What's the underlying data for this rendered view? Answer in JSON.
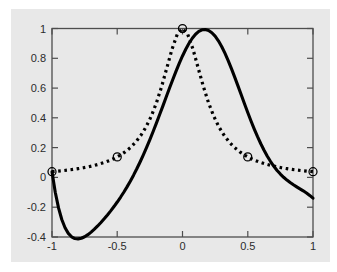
{
  "figure": {
    "background_color": "#e8e8e8",
    "page_background_color": "#ffffff",
    "axis_color": "#4d4d4d",
    "curve_color": "#000000"
  },
  "chart_data": {
    "type": "line",
    "title": "",
    "subtitle": "",
    "xlabel": "",
    "ylabel": "",
    "xlim": [
      -1,
      1
    ],
    "ylim": [
      -0.4,
      1
    ],
    "grid": false,
    "legend": null,
    "legend_position": "none",
    "xticks": [
      -1,
      -0.5,
      0,
      0.5,
      1
    ],
    "xticklabels": [
      "-1",
      "-0.5",
      "0",
      "0.5",
      "1"
    ],
    "yticks": [
      -0.4,
      -0.2,
      0,
      0.2,
      0.4,
      0.6,
      0.8,
      1
    ],
    "yticklabels": [
      "-0.4",
      "-0.2",
      "0",
      "0.2",
      "0.4",
      "0.6",
      "0.8",
      "1"
    ],
    "series": [
      {
        "name": "interpolant",
        "style": "solid",
        "linewidth": 3.1,
        "color": "#000000",
        "x": [
          -1.0,
          -0.975,
          -0.95,
          -0.925,
          -0.9,
          -0.875,
          -0.85,
          -0.825,
          -0.8,
          -0.775,
          -0.75,
          -0.725,
          -0.7,
          -0.675,
          -0.65,
          -0.625,
          -0.6,
          -0.575,
          -0.55,
          -0.525,
          -0.5,
          -0.475,
          -0.45,
          -0.425,
          -0.4,
          -0.375,
          -0.35,
          -0.325,
          -0.3,
          -0.275,
          -0.25,
          -0.225,
          -0.2,
          -0.175,
          -0.15,
          -0.125,
          -0.1,
          -0.075,
          -0.05,
          -0.025,
          0.0,
          0.025,
          0.05,
          0.075,
          0.1,
          0.125,
          0.15,
          0.175,
          0.2,
          0.225,
          0.25,
          0.275,
          0.3,
          0.325,
          0.35,
          0.375,
          0.4,
          0.425,
          0.45,
          0.475,
          0.5,
          0.525,
          0.55,
          0.575,
          0.6,
          0.625,
          0.65,
          0.675,
          0.7,
          0.725,
          0.75,
          0.775,
          0.8,
          0.825,
          0.85,
          0.875,
          0.9,
          0.925,
          0.95,
          0.975,
          1.0
        ],
        "y": [
          0.0385,
          -0.0996,
          -0.2046,
          -0.2824,
          -0.3379,
          -0.3755,
          -0.3986,
          -0.4102,
          -0.4127,
          -0.4083,
          -0.3984,
          -0.3844,
          -0.3672,
          -0.3475,
          -0.3259,
          -0.3026,
          -0.2779,
          -0.2518,
          -0.2244,
          -0.1955,
          -0.1652,
          -0.1332,
          -0.0993,
          -0.0634,
          -0.0253,
          0.0152,
          0.0581,
          0.1035,
          0.1513,
          0.2015,
          0.2539,
          0.3083,
          0.3645,
          0.4221,
          0.4806,
          0.5396,
          0.5983,
          0.6561,
          0.7122,
          0.7656,
          0.8155,
          0.8609,
          0.9009,
          0.9347,
          0.9614,
          0.9803,
          0.9911,
          0.9933,
          0.9868,
          0.9717,
          0.9484,
          0.9172,
          0.879,
          0.8345,
          0.7848,
          0.7308,
          0.6737,
          0.6146,
          0.5546,
          0.4948,
          0.436,
          0.3791,
          0.3248,
          0.2737,
          0.226,
          0.1823,
          0.1425,
          0.1068,
          0.075,
          0.047,
          0.0224,
          0.0009,
          -0.0179,
          -0.0345,
          -0.0494,
          -0.0631,
          -0.0764,
          -0.0899,
          -0.1044,
          -0.1206,
          -0.1395
        ]
      },
      {
        "name": "runge-function",
        "style": "dotted",
        "linewidth": 3.2,
        "color": "#000000",
        "x": [
          -1.0,
          -0.96,
          -0.92,
          -0.88,
          -0.84,
          -0.8,
          -0.76,
          -0.72,
          -0.68,
          -0.64,
          -0.6,
          -0.56,
          -0.52,
          -0.48,
          -0.44,
          -0.4,
          -0.36,
          -0.32,
          -0.28,
          -0.24,
          -0.2,
          -0.16,
          -0.12,
          -0.08,
          -0.04,
          0.0,
          0.04,
          0.08,
          0.12,
          0.16,
          0.2,
          0.24,
          0.28,
          0.32,
          0.36,
          0.4,
          0.44,
          0.48,
          0.52,
          0.56,
          0.6,
          0.64,
          0.68,
          0.72,
          0.76,
          0.8,
          0.84,
          0.88,
          0.92,
          0.96,
          1.0
        ],
        "y": [
          0.0385,
          0.0416,
          0.0451,
          0.0491,
          0.0536,
          0.0588,
          0.0647,
          0.0716,
          0.0796,
          0.089,
          0.1,
          0.1131,
          0.1289,
          0.1479,
          0.1713,
          0.2,
          0.2358,
          0.2809,
          0.3378,
          0.4098,
          0.5,
          0.6098,
          0.7353,
          0.8621,
          0.9615,
          1.0,
          0.9615,
          0.8621,
          0.7353,
          0.6098,
          0.5,
          0.4098,
          0.3378,
          0.2809,
          0.2358,
          0.2,
          0.1713,
          0.1479,
          0.1289,
          0.1131,
          0.1,
          0.089,
          0.0796,
          0.0716,
          0.0647,
          0.0588,
          0.0536,
          0.0491,
          0.0451,
          0.0416,
          0.0385
        ]
      }
    ],
    "markers": {
      "shape": "circle",
      "filled": false,
      "radius_px": 4,
      "points": [
        {
          "x": -1.0,
          "y": 0.0385
        },
        {
          "x": -0.5,
          "y": 0.1379
        },
        {
          "x": 0.0,
          "y": 1.0
        },
        {
          "x": 0.5,
          "y": 0.1379
        },
        {
          "x": 1.0,
          "y": 0.0385
        }
      ]
    }
  }
}
